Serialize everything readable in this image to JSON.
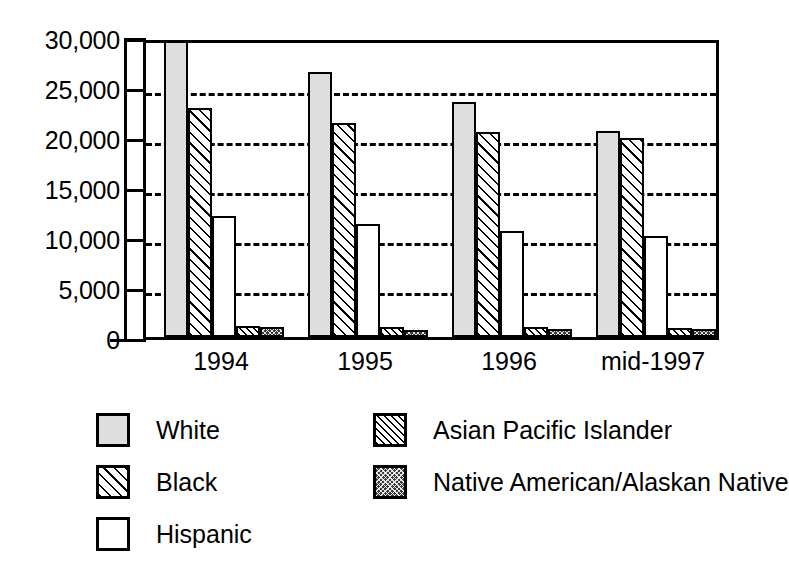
{
  "chart_data": {
    "type": "bar",
    "title": "",
    "subtitle": "",
    "xlabel": "",
    "ylabel": "",
    "categories": [
      "1994",
      "1995",
      "1996",
      "mid-1997"
    ],
    "ylim": [
      0,
      30000
    ],
    "ytick_values": [
      0,
      5000,
      10000,
      15000,
      20000,
      25000,
      30000
    ],
    "ytick_labels": [
      "0",
      "5,000",
      "10,000",
      "15,000",
      "20,000",
      "25,000",
      "30,000"
    ],
    "grid": true,
    "grid_style": "dashed horizontal",
    "legend_position": "below",
    "series": [
      {
        "name": "White",
        "pattern": "light-gray-fill",
        "values": [
          30900,
          26500,
          23500,
          20600
        ]
      },
      {
        "name": "Black",
        "pattern": "diagonal-hatch",
        "values": [
          22900,
          21400,
          20500,
          19900
        ]
      },
      {
        "name": "Hispanic",
        "pattern": "plain-white",
        "values": [
          12100,
          11300,
          10600,
          10100
        ]
      },
      {
        "name": "Asian Pacific Islander",
        "pattern": "dense-diagonal-hatch",
        "values": [
          1100,
          1000,
          1050,
          900
        ]
      },
      {
        "name": "Native American/Alaskan Native",
        "pattern": "dark-checkered",
        "values": [
          1050,
          750,
          800,
          800
        ]
      }
    ]
  },
  "axis": {
    "y_ticks": [
      {
        "label": "30,000",
        "value": 30000
      },
      {
        "label": "25,000",
        "value": 25000
      },
      {
        "label": "20,000",
        "value": 20000
      },
      {
        "label": "15,000",
        "value": 15000
      },
      {
        "label": "10,000",
        "value": 10000
      },
      {
        "label": "5,000",
        "value": 5000
      },
      {
        "label": "0",
        "value": 0
      }
    ],
    "x_ticks": [
      {
        "label": "1994"
      },
      {
        "label": "1995"
      },
      {
        "label": "1996"
      },
      {
        "label": "mid-1997"
      }
    ]
  },
  "legend": {
    "left_column": [
      {
        "label": "White",
        "pattern": "light-gray-fill"
      },
      {
        "label": "Black",
        "pattern": "diagonal-hatch"
      },
      {
        "label": "Hispanic",
        "pattern": "plain-white"
      }
    ],
    "right_column": [
      {
        "label": "Asian Pacific Islander",
        "pattern": "dense-diagonal-hatch"
      },
      {
        "label": "Native American/Alaskan Native",
        "pattern": "dark-checkered"
      }
    ]
  },
  "colors": {
    "white_series": "#dedede",
    "native_series": "#3b3b3b",
    "line": "#000000",
    "background": "#ffffff"
  }
}
